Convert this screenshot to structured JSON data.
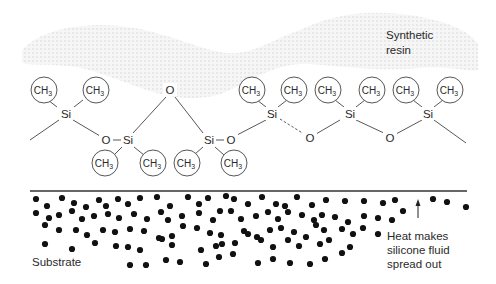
{
  "diagram": {
    "labels": {
      "resin": [
        "Synthetic",
        "resin"
      ],
      "substrate": "Substrate",
      "heat": [
        "Heat makes",
        "silicone fluid",
        "spread out"
      ]
    },
    "atoms": {
      "silicon": "Si",
      "oxygen": "O",
      "methyl_main": "CH",
      "methyl_sub": "3"
    },
    "colors": {
      "ink": "#2a2a2a",
      "resin_fill": "#e6e6e6",
      "particle": "#111111",
      "surface_line": "#333333"
    },
    "icons": {
      "heat_arrow": "arrow-up-icon"
    }
  }
}
